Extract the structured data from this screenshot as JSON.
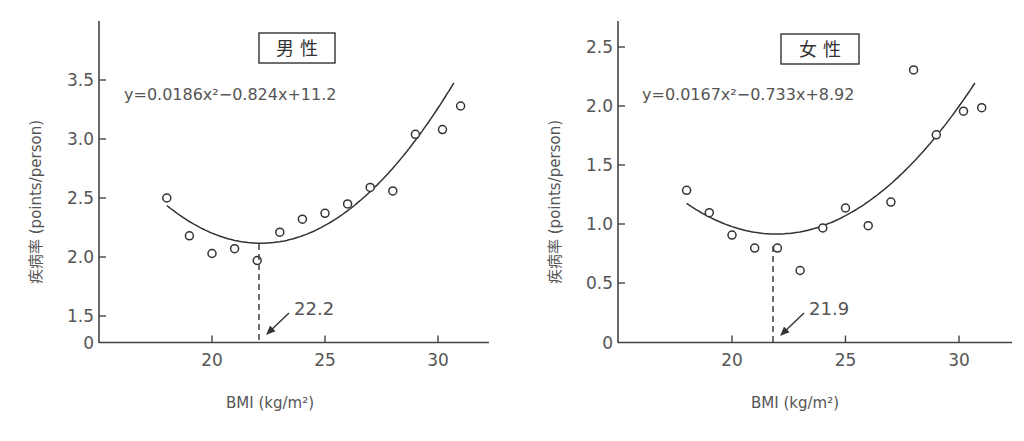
{
  "chart_data": [
    {
      "type": "scatter",
      "panel": "left",
      "title": "男 性",
      "equation": "y=0.0186x²−0.824x+11.2",
      "fit": {
        "a": 0.0186,
        "b": -0.824,
        "c": 11.2,
        "x_range": [
          18,
          31
        ]
      },
      "xlabel": "BMI (kg/m²)",
      "ylabel": "疾病率 (points/person)",
      "x_ticks": [
        20,
        25,
        30
      ],
      "y_ticks": [
        "0",
        "1.5",
        "2.0",
        "2.5",
        "3.0",
        "3.5"
      ],
      "y_axis_break": "0 to 1.5",
      "ylim": [
        1.5,
        3.9
      ],
      "xlim": [
        15.9,
        32.3
      ],
      "optimum_annotation": "22.2",
      "optimum_x": 22.2,
      "x": [
        18,
        19,
        20,
        21,
        22,
        23,
        24,
        25,
        26,
        27,
        28,
        29,
        30.2,
        31
      ],
      "values": [
        2.5,
        2.18,
        2.03,
        2.07,
        1.97,
        2.21,
        2.32,
        2.37,
        2.45,
        2.59,
        2.56,
        3.04,
        3.08,
        3.28
      ],
      "grid": false
    },
    {
      "type": "scatter",
      "panel": "right",
      "title": "女 性",
      "equation": "y=0.0167x²−0.733x+8.92",
      "fit": {
        "a": 0.0167,
        "b": -0.733,
        "c": 8.92,
        "x_range": [
          18,
          31
        ]
      },
      "xlabel": "BMI (kg/m²)",
      "ylabel": "疾病率 (points/person)",
      "x_ticks": [
        20,
        25,
        30
      ],
      "y_ticks": [
        "0",
        "0.5",
        "1.0",
        "1.5",
        "2.0",
        "2.5"
      ],
      "ylim": [
        0,
        2.7
      ],
      "xlim": [
        15.9,
        32.3
      ],
      "optimum_annotation": "21.9",
      "optimum_x": 21.9,
      "x": [
        18,
        19,
        20,
        21,
        22,
        23,
        24,
        25,
        26,
        27,
        28,
        29,
        30.2,
        31
      ],
      "values": [
        1.29,
        1.1,
        0.91,
        0.8,
        0.8,
        0.61,
        0.97,
        1.14,
        0.99,
        1.19,
        2.31,
        1.76,
        1.96,
        1.99
      ],
      "grid": false
    }
  ],
  "panels": {
    "left": {
      "title": "男 性",
      "equation": "y=0.0186x²−0.824x+11.2",
      "annotation": "22.2",
      "xlabel": "BMI (kg/m²)",
      "ylabel": "疾病率 (points/person)"
    },
    "right": {
      "title": "女 性",
      "equation": "y=0.0167x²−0.733x+8.92",
      "annotation": "21.9",
      "xlabel": "BMI (kg/m²)",
      "ylabel": "疾病率 (points/person)"
    }
  }
}
